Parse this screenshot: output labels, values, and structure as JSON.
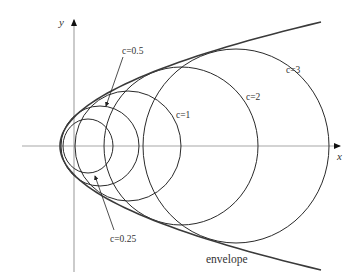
{
  "diagram": {
    "colors": {
      "axis": "#a8a8a8",
      "circle": "#2a2a2a",
      "envelope": "#3a3a3a",
      "text": "#333333"
    },
    "axes": {
      "x_label": "x",
      "y_label": "y",
      "origin_px": [
        74,
        146
      ]
    },
    "circles": [
      {
        "param": "c=0.25",
        "cx": 88,
        "cy": 146,
        "rx": 25,
        "ry": 27
      },
      {
        "param": "c=0.5",
        "cx": 100,
        "cy": 146,
        "rx": 39,
        "ry": 40
      },
      {
        "param": "c=1",
        "cx": 128,
        "cy": 146,
        "rx": 53,
        "ry": 55
      },
      {
        "param": "c=2",
        "cx": 181,
        "cy": 146,
        "rx": 77,
        "ry": 79
      },
      {
        "param": "c=3",
        "cx": 236,
        "cy": 146,
        "rx": 93,
        "ry": 97
      }
    ],
    "envelope": {
      "label": "envelope",
      "vertex_px": [
        60,
        146
      ],
      "end_top_px": [
        321,
        22
      ],
      "end_bottom_px": [
        321,
        268
      ]
    },
    "labels": {
      "c025": "c=0.25",
      "c05": "c=0.5",
      "c1": "c=1",
      "c2": "c=2",
      "c3": "c=3",
      "envelope": "envelope"
    }
  }
}
